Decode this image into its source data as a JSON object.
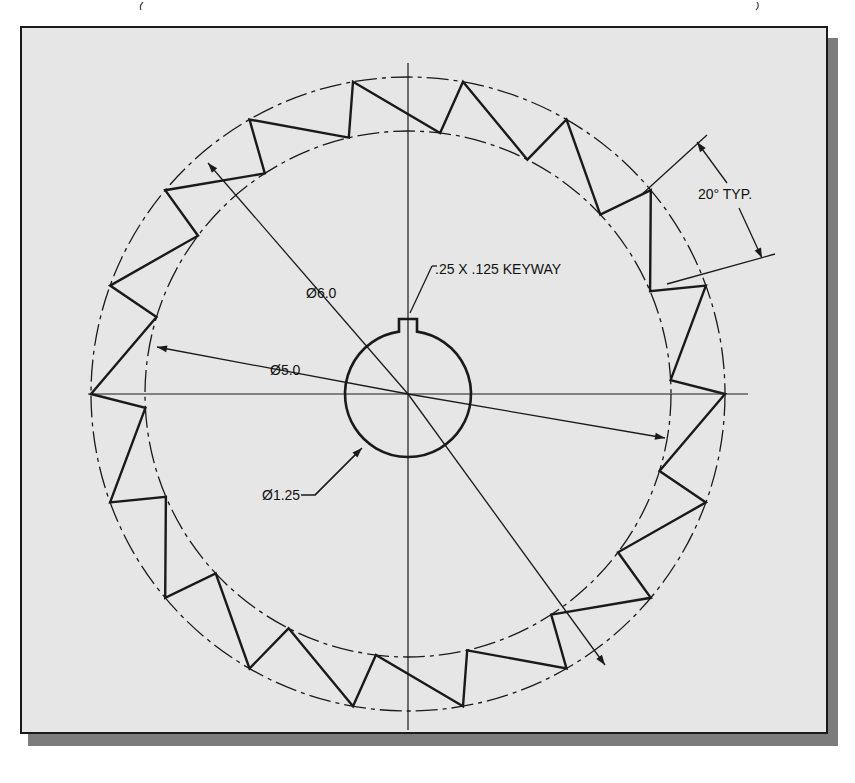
{
  "drawing": {
    "title": "Gear / ratchet wheel with keyway",
    "colors": {
      "paper": "#e6e6e6",
      "ink": "#1a1a1a",
      "shadow": "#7c7c7c",
      "background": "#ffffff"
    },
    "geometry": {
      "center": [
        408,
        394
      ],
      "outer_circle_radius_px": 317,
      "inner_circle_radius_px": 263,
      "hub_radius_px": 63,
      "tooth_count": 18,
      "tooth_pitch_deg": 20
    },
    "annotations": {
      "angle_label": "20° TYP.",
      "keyway_label": ".25 X .125 KEYWAY",
      "outer_diameter_label": "Ø6.0",
      "inner_diameter_label": "Ø5.0",
      "hub_diameter_label": "Ø1.25"
    }
  }
}
